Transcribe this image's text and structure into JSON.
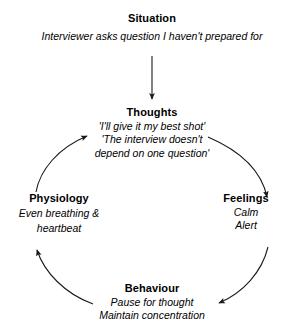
{
  "diagram": {
    "title_visible": false,
    "stroke_color": "#1a1a1a",
    "text_color": "#000000",
    "background_color": "#ffffff",
    "flow_direction": "clockwise"
  },
  "situation": {
    "title": "Situation",
    "line1": "Interviewer asks question I haven't prepared for"
  },
  "thoughts": {
    "title": "Thoughts",
    "line1": "'I'll give it my best shot'",
    "line2": "'The interview doesn't",
    "line3": "depend on one question'"
  },
  "feelings": {
    "title": "Feelings",
    "line1": "Calm",
    "line2": "Alert"
  },
  "behaviour": {
    "title": "Behaviour",
    "line1": "Pause for thought",
    "line2": "Maintain concentration"
  },
  "physiology": {
    "title": "Physiology",
    "line1": "Even breathing &",
    "line2": "heartbeat"
  },
  "connectors": {
    "situation_to_thoughts": "straight-arrow-down",
    "thoughts_to_feelings": "arc-arrow-clockwise",
    "feelings_to_behaviour": "arc-arrow-clockwise",
    "behaviour_to_physiology": "arc-arrow-clockwise",
    "physiology_to_thoughts": "arc-arrow-clockwise"
  }
}
